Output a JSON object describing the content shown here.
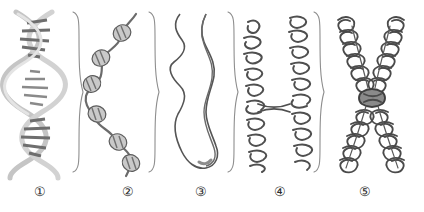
{
  "figure": {
    "background_color": "#ffffff",
    "width": 424,
    "height": 212,
    "ink_color": "#4a4a4a",
    "dark_ink_color": "#3a3a3a",
    "light_ink_color": "#b8b8b8",
    "bead_fill": "#c9c9c9",
    "label_color": "#2b2b2b"
  },
  "panels": [
    {
      "id": "panel-1",
      "label": "①",
      "name": "dna-double-helix",
      "label_x": 28,
      "label_y": 185
    },
    {
      "id": "panel-2",
      "label": "②",
      "name": "nucleosome-beads-on-string",
      "label_x": 116,
      "label_y": 185
    },
    {
      "id": "panel-3",
      "label": "③",
      "name": "chromatin-fiber-loop",
      "label_x": 189,
      "label_y": 185
    },
    {
      "id": "panel-4",
      "label": "④",
      "name": "coiled-chromatid-arms",
      "label_x": 268,
      "label_y": 185
    },
    {
      "id": "panel-5",
      "label": "⑤",
      "name": "condensed-chromosome",
      "label_x": 353,
      "label_y": 185
    }
  ],
  "braces": [
    {
      "name": "brace-after-panel-1",
      "x": 73,
      "top": 12,
      "bottom": 172
    },
    {
      "name": "brace-after-panel-2",
      "x": 149,
      "top": 12,
      "bottom": 172
    },
    {
      "name": "brace-after-panel-3",
      "x": 228,
      "top": 12,
      "bottom": 172
    },
    {
      "name": "brace-after-panel-4",
      "x": 314,
      "top": 12,
      "bottom": 172
    }
  ]
}
